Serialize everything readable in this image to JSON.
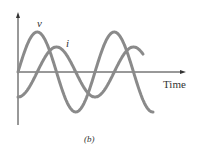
{
  "figure": {
    "caption": "(b)",
    "x_axis_label": "Time",
    "curves": [
      {
        "name": "v",
        "label": "v",
        "color": "#8a8a8a",
        "amplitude_px": 40,
        "phase_deg": 0
      },
      {
        "name": "i",
        "label": "i",
        "color": "#8a8a8a",
        "amplitude_px": 25,
        "phase_deg": -90
      }
    ],
    "axis_color": "#333333"
  }
}
